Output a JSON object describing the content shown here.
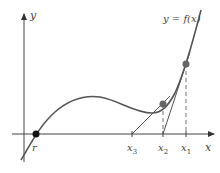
{
  "diagram": {
    "curve_label": "y = f(x)",
    "axis_labels": {
      "x": "x",
      "y": "y"
    },
    "root_label": "r",
    "iterate_labels": [
      "x1",
      "x2",
      "x3"
    ],
    "iterate_label_display": {
      "x1": "x",
      "x1_sub": "1",
      "x2": "x",
      "x2_sub": "2",
      "x3": "x",
      "x3_sub": "3"
    },
    "colors": {
      "curve": "#555555",
      "axis": "#444444",
      "point": "#666666",
      "root_point": "#111111",
      "tangent": "#555555",
      "dashed": "#777777"
    }
  }
}
